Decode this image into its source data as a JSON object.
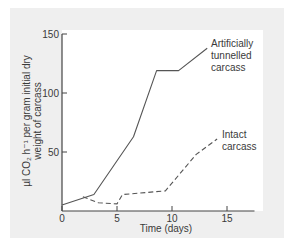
{
  "chart_data": {
    "type": "line",
    "title": "",
    "xlabel": "Time (days)",
    "ylabel_lines": [
      "µl CO₂ h⁻¹ per gram initial dry",
      "weight of carcass"
    ],
    "ylabel": "µl CO₂ h⁻¹ per gram initial dry weight of carcass",
    "xlim": [
      0,
      17.5
    ],
    "ylim": [
      0,
      150
    ],
    "x_ticks": [
      0,
      5,
      10,
      15
    ],
    "x_tick_labels": [
      "0",
      "5",
      "10",
      "15"
    ],
    "y_ticks": [
      50,
      100,
      150
    ],
    "y_tick_labels": [
      "50",
      "100",
      "150"
    ],
    "grid": false,
    "legend": "inline labels at line ends",
    "series": [
      {
        "name": "Artificially tunnelled carcass",
        "label_lines": [
          "Artificially",
          "tunnelled",
          "carcass"
        ],
        "style": "solid",
        "color": "#555555",
        "x": [
          0,
          2.9,
          6.5,
          8.6,
          10.6,
          13.2
        ],
        "values": [
          5,
          14,
          63,
          119,
          119,
          138
        ]
      },
      {
        "name": "Intact carcass",
        "label_lines": [
          "Intact",
          "carcass"
        ],
        "style": "dashed",
        "color": "#555555",
        "x": [
          1.9,
          3.3,
          5.0,
          5.5,
          9.4,
          12.2,
          14.1
        ],
        "values": [
          12,
          7,
          6,
          14,
          17,
          48,
          61
        ]
      }
    ]
  },
  "colors": {
    "panel_bg": "#efefef",
    "plot_bg": "#ffffff",
    "axis": "#444444",
    "line": "#555555",
    "text": "#3a3a3a"
  }
}
